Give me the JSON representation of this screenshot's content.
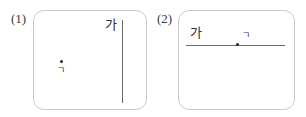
{
  "figure": {
    "width": 306,
    "height": 117,
    "background_color": "#ffffff",
    "line_color": "#6a6a6a",
    "point_color": "#262626",
    "box_border_color": "#c9c9c9",
    "label_color": "#2e2e2e"
  },
  "panels": [
    {
      "index_label": "(1)",
      "line": {
        "orientation": "vertical",
        "label": "가",
        "label_position": "top-left-of-line"
      },
      "point": {
        "label": "ㄱ",
        "label_position": "below-point",
        "relation": "point not on line"
      }
    },
    {
      "index_label": "(2)",
      "line": {
        "orientation": "horizontal",
        "label": "가",
        "label_position": "above-left-end"
      },
      "point": {
        "label": "ㄱ",
        "label_position": "above-point",
        "relation": "point on line"
      }
    }
  ]
}
